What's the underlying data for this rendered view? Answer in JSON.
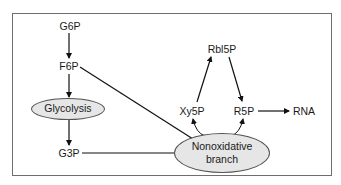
{
  "diagram": {
    "type": "metabolic-pathway",
    "nodes": {
      "g6p": "G6P",
      "f6p": "F6P",
      "glycolysis": "Glycolysis",
      "g3p": "G3P",
      "rbl5p": "Rbl5P",
      "xy5p": "Xy5P",
      "r5p": "R5P",
      "rna": "RNA",
      "nonoxidative_line1": "Nonoxidative",
      "nonoxidative_line2": "branch"
    },
    "edges": [
      {
        "from": "G6P",
        "to": "F6P"
      },
      {
        "from": "F6P",
        "to": "Glycolysis"
      },
      {
        "from": "Glycolysis",
        "to": "G3P"
      },
      {
        "from": "F6P",
        "to": "Nonoxidative branch"
      },
      {
        "from": "G3P",
        "to": "Nonoxidative branch"
      },
      {
        "from": "Xy5P",
        "to": "Rbl5P"
      },
      {
        "from": "Rbl5P",
        "to": "R5P"
      },
      {
        "from": "R5P",
        "to": "RNA"
      },
      {
        "from": "Nonoxidative branch",
        "to": "Xy5P"
      },
      {
        "from": "Nonoxidative branch",
        "to": "R5P"
      }
    ],
    "colors": {
      "ellipse_fill": "#e6e6e6",
      "stroke": "#111111",
      "frame": "#6e6e6e"
    }
  }
}
